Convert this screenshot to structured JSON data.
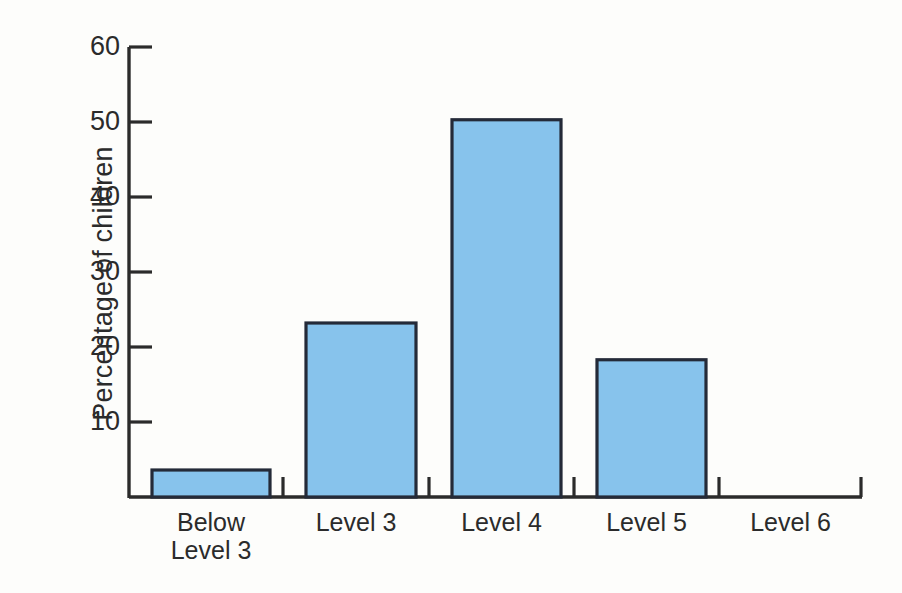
{
  "chart_data": {
    "type": "bar",
    "title": "",
    "subtitle": "",
    "xlabel": "",
    "ylabel": "Percentage of children",
    "categories": [
      "Below\nLevel 3",
      "Level 3",
      "Level 4",
      "Level 5",
      "Level 6"
    ],
    "values": [
      3.6,
      23.2,
      50.3,
      18.3,
      0
    ],
    "ylim": [
      0,
      60
    ],
    "yticks": [
      10,
      20,
      30,
      40,
      50,
      60
    ],
    "ytick_labels": [
      "10",
      "20",
      "30",
      "40",
      "50",
      "60"
    ],
    "grid": false,
    "legend": null,
    "series": [
      {
        "name": "Percentage of children",
        "values": [
          3.6,
          23.2,
          50.3,
          18.3,
          0
        ]
      }
    ],
    "annotations": []
  },
  "style": {
    "bar_fill": "#87c3ec",
    "bar_stroke": "#242a38",
    "axis_color": "#2b2b2b",
    "text_color": "#2b2b2b",
    "background": "#fdfdfb"
  }
}
